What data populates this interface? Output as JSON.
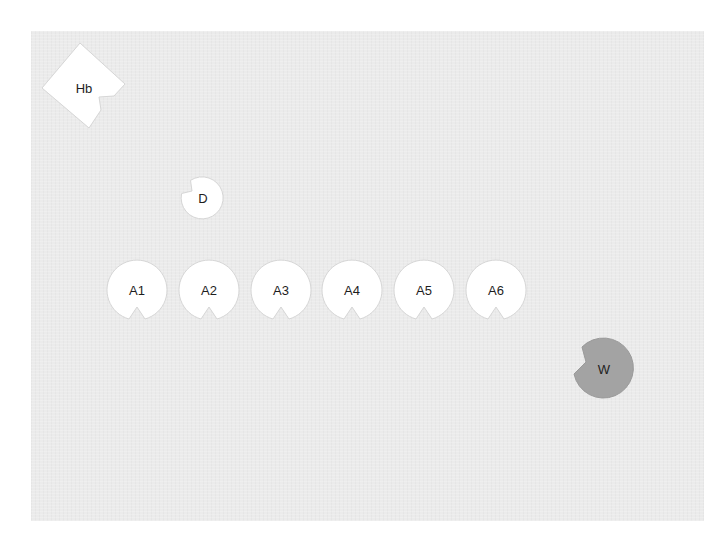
{
  "board": {
    "background": "#ebebeb",
    "page_background": "#ffffff"
  },
  "pieces": {
    "hb": {
      "label": "Hb",
      "shape": "notched-diamond",
      "fill": "#ffffff"
    },
    "d": {
      "label": "D",
      "shape": "notched-circle",
      "fill": "#ffffff"
    },
    "a1": {
      "label": "A1",
      "shape": "notched-circle",
      "fill": "#ffffff"
    },
    "a2": {
      "label": "A2",
      "shape": "notched-circle",
      "fill": "#ffffff"
    },
    "a3": {
      "label": "A3",
      "shape": "notched-circle",
      "fill": "#ffffff"
    },
    "a4": {
      "label": "A4",
      "shape": "notched-circle",
      "fill": "#ffffff"
    },
    "a5": {
      "label": "A5",
      "shape": "notched-circle",
      "fill": "#ffffff"
    },
    "a6": {
      "label": "A6",
      "shape": "notched-circle",
      "fill": "#ffffff"
    },
    "w": {
      "label": "W",
      "shape": "notched-circle",
      "fill": "#a3a3a3"
    }
  }
}
